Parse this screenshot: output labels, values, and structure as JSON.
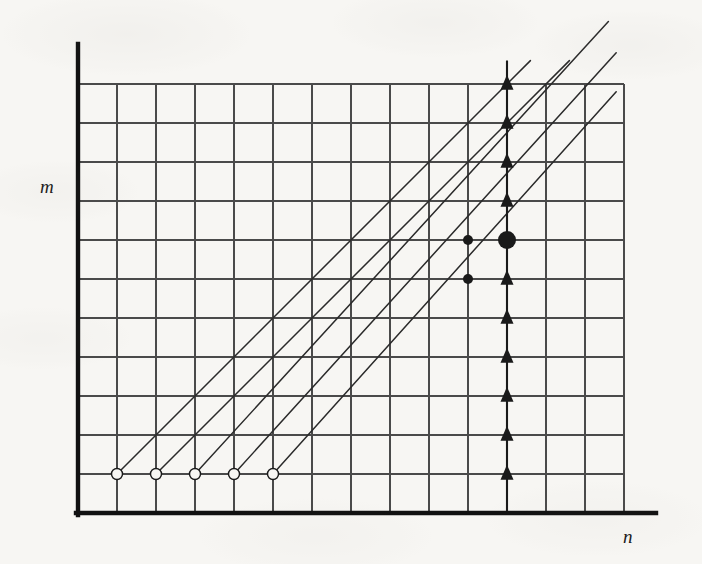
{
  "figure": {
    "caption": "",
    "background_color": "#f7f6f3",
    "ink_color": "#1a1a1a",
    "grid_color": "#4a4a4a",
    "axis_label_x": "n",
    "axis_label_y": "m"
  },
  "chart_data": {
    "type": "scatter",
    "title": "",
    "xlabel": "n",
    "ylabel": "m",
    "grid": true,
    "legend": false,
    "xlim": [
      0,
      14
    ],
    "ylim": [
      0,
      12
    ],
    "grid_spacing": 1,
    "axes": {
      "origin_px": [
        78,
        513
      ],
      "cell_px": 39,
      "x_gridlines": 14,
      "y_gridlines": 11,
      "x_axis_extends_beyond_grid": true,
      "y_axis_extends_above_grid": true
    },
    "series": [
      {
        "name": "open-circles",
        "marker": "open-circle",
        "fill": "none",
        "stroke": "#1a1a1a",
        "radius_px": 5.5,
        "points": [
          {
            "n": 1,
            "m": 1
          },
          {
            "n": 2,
            "m": 1
          },
          {
            "n": 3,
            "m": 1
          },
          {
            "n": 4,
            "m": 1
          },
          {
            "n": 5,
            "m": 1
          }
        ]
      },
      {
        "name": "small-filled-dots",
        "marker": "filled-circle",
        "fill": "#1a1a1a",
        "radius_px": 5,
        "points": [
          {
            "n": 10,
            "m": 6
          },
          {
            "n": 10,
            "m": 7
          }
        ]
      },
      {
        "name": "large-filled-dot",
        "marker": "filled-circle",
        "fill": "#1a1a1a",
        "radius_px": 9,
        "points": [
          {
            "n": 11,
            "m": 7
          }
        ]
      },
      {
        "name": "up-triangles",
        "marker": "filled-triangle-up",
        "fill": "#1a1a1a",
        "size_px": 13,
        "points": [
          {
            "n": 11,
            "m": 1
          },
          {
            "n": 11,
            "m": 2
          },
          {
            "n": 11,
            "m": 3
          },
          {
            "n": 11,
            "m": 4
          },
          {
            "n": 11,
            "m": 5
          },
          {
            "n": 11,
            "m": 6
          },
          {
            "n": 11,
            "m": 8
          },
          {
            "n": 11,
            "m": 9
          },
          {
            "n": 11,
            "m": 10
          },
          {
            "n": 11,
            "m": 11
          }
        ]
      }
    ],
    "rays": {
      "name": "diagonal-rays",
      "slope": 1,
      "stroke": "#2a2a2a",
      "description": "45-degree rays emanating up-right from each open circle, extending past the top-right of the grid",
      "origins": [
        {
          "n": 1,
          "m": 1
        },
        {
          "n": 2,
          "m": 1
        },
        {
          "n": 3,
          "m": 1
        },
        {
          "n": 4,
          "m": 1
        },
        {
          "n": 5,
          "m": 1
        }
      ],
      "ends": [
        {
          "n": 11.6,
          "m": 11.6
        },
        {
          "n": 12.6,
          "m": 11.6
        },
        {
          "n": 13.6,
          "m": 12.6
        },
        {
          "n": 13.8,
          "m": 11.8
        },
        {
          "n": 13.8,
          "m": 10.8
        }
      ]
    },
    "vertical_marker_line": {
      "n": 11,
      "from_m": 0,
      "to_m": 11.6,
      "stroke": "#1a1a1a",
      "description": "vertical stem through the column of triangles and the large filled dot"
    }
  }
}
